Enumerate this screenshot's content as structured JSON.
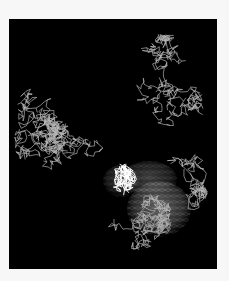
{
  "figure": {
    "background_color": "#f7f7f7",
    "panel_color": "#000000",
    "panel": {
      "x": 9,
      "y": 19,
      "width": 208,
      "height": 250
    },
    "render_style": "wireframe-sticks",
    "stroke_color": "#b8b8b8",
    "highlight_color": "#ffffff",
    "surface_color": "#9a9a9a"
  },
  "structure": {
    "clusters": [
      {
        "name": "left-domain",
        "cx": 55,
        "cy": 120,
        "rx": 50,
        "ry": 95,
        "segments": 520,
        "seed": 11
      },
      {
        "name": "right-upper-domain",
        "cx": 150,
        "cy": 75,
        "rx": 45,
        "ry": 60,
        "segments": 300,
        "seed": 23
      },
      {
        "name": "bottom-center-domain",
        "cx": 105,
        "cy": 200,
        "rx": 60,
        "ry": 38,
        "segments": 300,
        "seed": 37
      },
      {
        "name": "right-lower-domain",
        "cx": 175,
        "cy": 150,
        "rx": 30,
        "ry": 45,
        "segments": 150,
        "seed": 41
      }
    ],
    "ligand_site": {
      "name": "bound-ligand",
      "cx": 110,
      "cy": 160,
      "rx": 18,
      "ry": 14,
      "segments": 140,
      "seed": 53
    },
    "surface_blobs": [
      {
        "name": "molecular-surface-main",
        "cx": 150,
        "cy": 190,
        "rx": 32,
        "ry": 28,
        "opacity": 0.55
      },
      {
        "name": "molecular-surface-upper",
        "cx": 140,
        "cy": 160,
        "rx": 28,
        "ry": 18,
        "opacity": 0.35
      },
      {
        "name": "molecular-surface-left",
        "cx": 112,
        "cy": 162,
        "rx": 18,
        "ry": 16,
        "opacity": 0.3
      }
    ]
  }
}
